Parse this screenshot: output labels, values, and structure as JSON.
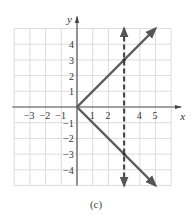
{
  "chart_data": {
    "type": "line",
    "title": "",
    "caption": "(c)",
    "xlabel": "x",
    "ylabel": "y",
    "xlim": [
      -4,
      6
    ],
    "ylim": [
      -5,
      5
    ],
    "grid": true,
    "x_ticks": [
      -3,
      -2,
      -1,
      1,
      2,
      4,
      5
    ],
    "x_tick_labels": [
      "−3",
      "−2",
      "−1",
      "1",
      "2",
      "4",
      "5"
    ],
    "y_ticks": [
      4,
      3,
      2,
      1,
      -1,
      -2,
      -3,
      -4
    ],
    "y_tick_labels": [
      "4",
      "3",
      "2",
      "1",
      "−1",
      "−2",
      "−3",
      "−4"
    ],
    "series": [
      {
        "name": "upper branch y = x",
        "style": "solid",
        "color": "#5a5a5a",
        "x": [
          0,
          5
        ],
        "y": [
          0,
          5
        ],
        "arrow_end": true
      },
      {
        "name": "lower branch y = -x",
        "style": "solid",
        "color": "#5a5a5a",
        "x": [
          0,
          5
        ],
        "y": [
          0,
          -5
        ],
        "arrow_end": true
      },
      {
        "name": "vertical line x = 3",
        "style": "dashed",
        "color": "#4a4a4a",
        "x": [
          3,
          3
        ],
        "y": [
          -5,
          5
        ],
        "arrow_both": true
      }
    ],
    "intersections": [
      [
        3,
        3
      ],
      [
        3,
        -3
      ]
    ]
  }
}
